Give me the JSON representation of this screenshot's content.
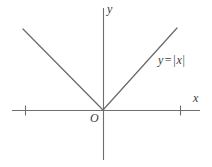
{
  "figure": {
    "title": "",
    "background_color": "#ffffff",
    "line_color": "#6a6a6a",
    "axis_color": "#6e6e6e",
    "text_color": "#3a3a3a",
    "width": 212,
    "height": 167
  },
  "labels": {
    "x_axis": "x",
    "y_axis": "y",
    "origin": "O",
    "equation_lhs": "y",
    "equation_sign": "=",
    "equation_bar_left": "|",
    "equation_var": "x",
    "equation_bar_right": "|",
    "equation_full": "y = |x|"
  },
  "chart_data": {
    "type": "line",
    "title": "",
    "xlabel": "x",
    "ylabel": "y",
    "grid": false,
    "legend": null,
    "annotations": [
      {
        "text": "y = |x|",
        "x": 4.8,
        "y": 5.3
      },
      {
        "text": "O",
        "x": -0.35,
        "y": -0.45
      }
    ],
    "axes": {
      "x_pixel_range": [
        12,
        200
      ],
      "y_pixel_range": [
        8,
        160
      ],
      "origin_pixel": [
        103,
        110
      ],
      "x_ticks_pixel": [
        25,
        180
      ],
      "y_ticks_pixel": [],
      "xlim": [
        -5.8,
        6.5
      ],
      "ylim": [
        -3.3,
        6.8
      ],
      "x_tick_values": [
        -5.2,
        5.2
      ],
      "x_tick_labels": [
        "",
        ""
      ],
      "units_per_pixel_x": 0.0645,
      "units_per_pixel_y": 0.0645
    },
    "series": [
      {
        "name": "y = |x|",
        "equation": "y = |x|",
        "color": "#6a6a6a",
        "x": [
          -5.2,
          0,
          4.8
        ],
        "y": [
          5.2,
          0,
          4.8
        ],
        "pixel_points": [
          [
            23,
            29
          ],
          [
            103,
            110
          ],
          [
            177,
            28
          ]
        ]
      }
    ]
  }
}
